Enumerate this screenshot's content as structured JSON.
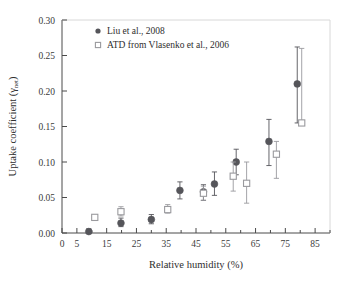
{
  "chart_data": {
    "type": "scatter",
    "title": "",
    "xlabel": "Relative humidity (%)",
    "ylabel": "Uptake coefficient (γnet)",
    "ylabel_main": "Uptake coefficient (γ",
    "ylabel_sub": "net",
    "ylabel_tail": ")",
    "xlim": [
      0,
      90
    ],
    "ylim": [
      0.0,
      0.3
    ],
    "grid": false,
    "legend_position": "top-left",
    "xticks": [
      0,
      5,
      15,
      25,
      35,
      45,
      55,
      65,
      75,
      85
    ],
    "xticklabels": [
      "0",
      "5",
      "15",
      "25",
      "35",
      "45",
      "55",
      "65",
      "75",
      "85"
    ],
    "xminor": [
      10,
      20,
      30,
      40,
      50,
      60,
      70,
      80,
      90
    ],
    "yticks": [
      0.0,
      0.05,
      0.1,
      0.15,
      0.2,
      0.25,
      0.3
    ],
    "yticklabels": [
      "0.00",
      "0.05",
      "0.10",
      "0.15",
      "0.20",
      "0.25",
      "0.30"
    ],
    "series": [
      {
        "name": "Liu et al., 2008",
        "marker": "filled-circle",
        "color": "#55555a",
        "points": [
          {
            "x": 9.0,
            "y": 0.002,
            "yerr_low": 0.0,
            "yerr_high": 0.006
          },
          {
            "x": 19.8,
            "y": 0.014,
            "yerr_low": 0.009,
            "yerr_high": 0.021
          },
          {
            "x": 30.0,
            "y": 0.019,
            "yerr_low": 0.013,
            "yerr_high": 0.026
          },
          {
            "x": 39.6,
            "y": 0.06,
            "yerr_low": 0.048,
            "yerr_high": 0.072
          },
          {
            "x": 47.5,
            "y": 0.058,
            "yerr_low": 0.046,
            "yerr_high": 0.068
          },
          {
            "x": 51.2,
            "y": 0.069,
            "yerr_low": 0.053,
            "yerr_high": 0.086
          },
          {
            "x": 58.5,
            "y": 0.1,
            "yerr_low": 0.082,
            "yerr_high": 0.118
          },
          {
            "x": 69.5,
            "y": 0.129,
            "yerr_low": 0.095,
            "yerr_high": 0.16
          },
          {
            "x": 79.0,
            "y": 0.21,
            "yerr_low": 0.155,
            "yerr_high": 0.262
          }
        ]
      },
      {
        "name": "ATD from Vlasenko et al., 2006",
        "marker": "open-square",
        "color": "#9a9a9e",
        "points": [
          {
            "x": 11.0,
            "y": 0.022,
            "yerr_low": 0.022,
            "yerr_high": 0.022
          },
          {
            "x": 19.8,
            "y": 0.03,
            "yerr_low": 0.024,
            "yerr_high": 0.037
          },
          {
            "x": 35.5,
            "y": 0.033,
            "yerr_low": 0.028,
            "yerr_high": 0.04
          },
          {
            "x": 47.5,
            "y": 0.056,
            "yerr_low": 0.046,
            "yerr_high": 0.066
          },
          {
            "x": 57.5,
            "y": 0.08,
            "yerr_low": 0.059,
            "yerr_high": 0.1
          },
          {
            "x": 62.0,
            "y": 0.07,
            "yerr_low": 0.042,
            "yerr_high": 0.1
          },
          {
            "x": 72.0,
            "y": 0.111,
            "yerr_low": 0.077,
            "yerr_high": 0.129
          },
          {
            "x": 80.5,
            "y": 0.155,
            "yerr_low": 0.155,
            "yerr_high": 0.26
          }
        ]
      }
    ]
  },
  "legend": {
    "items": [
      {
        "label": "Liu et al., 2008",
        "marker": "filled-circle",
        "color": "#55555a"
      },
      {
        "label": "ATD from Vlasenko et al., 2006",
        "marker": "open-square",
        "color": "#9a9a9e"
      }
    ]
  }
}
